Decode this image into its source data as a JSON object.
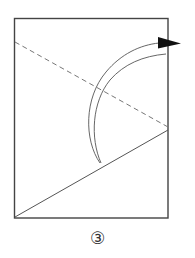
{
  "diagram": {
    "type": "origami-fold-step",
    "step_label": "③",
    "colors": {
      "stroke": "#555555",
      "paper_border": "#444444",
      "arrowhead": "#111111",
      "background": "#ffffff"
    },
    "paper": {
      "x": 14,
      "y": 18,
      "width": 154,
      "height": 200
    },
    "valley_fold_line": {
      "style": "dashed",
      "x1": 15,
      "y1": 42,
      "x2": 168,
      "y2": 127
    },
    "crease_line": {
      "style": "solid",
      "x1": 15,
      "y1": 217,
      "x2": 168,
      "y2": 130
    },
    "fold_arrow": {
      "description": "curved fold arrow pointing right over the top-right edge",
      "tip": {
        "x": 101,
        "y": 163
      },
      "head": {
        "x": 180,
        "y": 43
      }
    }
  }
}
